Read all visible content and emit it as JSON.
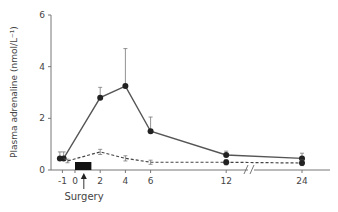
{
  "chart_data": {
    "type": "line",
    "title": "",
    "xlabel": "",
    "ylabel": "Plasma adrenaline (nmol/L⁻¹)",
    "ylim": [
      0,
      6
    ],
    "yticks": [
      0,
      2,
      4,
      6
    ],
    "xticks": [
      -1,
      0,
      2,
      4,
      6,
      12,
      24
    ],
    "x_axis_break": "between 12 and 24",
    "grid": false,
    "annotations": [
      {
        "text": "Surgery",
        "x": 0.7,
        "kind": "arrow-up"
      },
      {
        "kind": "black-bar",
        "x_start": 0,
        "x_end": 1.3
      }
    ],
    "series": [
      {
        "name": "solid",
        "style": "solid-line-filled-markers",
        "x": [
          -1.2,
          -0.9,
          2,
          4,
          6,
          12,
          24
        ],
        "values": [
          0.45,
          0.45,
          2.8,
          3.25,
          1.5,
          0.58,
          0.45
        ],
        "error_upper": [
          0.7,
          0.7,
          3.2,
          4.7,
          2.05,
          0.73,
          0.65
        ]
      },
      {
        "name": "dashed",
        "style": "dashed-line",
        "x": [
          -0.9,
          -0.6,
          2,
          4,
          6,
          12,
          24
        ],
        "values": [
          0.45,
          0.35,
          0.7,
          0.45,
          0.3,
          0.3,
          0.27
        ],
        "error_upper": [
          null,
          0.42,
          0.8,
          0.55,
          0.38,
          0.4,
          0.38
        ],
        "error_lower": [
          null,
          0.28,
          0.6,
          0.35,
          0.22,
          0.2,
          0.17
        ]
      }
    ]
  }
}
